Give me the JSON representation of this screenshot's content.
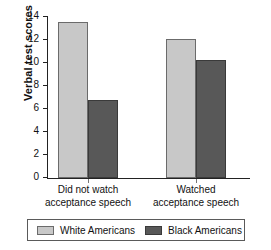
{
  "chart_data": {
    "type": "bar",
    "title": "",
    "xlabel": "",
    "ylabel": "Verbal test scores",
    "ylim": [
      0,
      14
    ],
    "ytick_labels": [
      "0",
      "2",
      "4",
      "6",
      "8",
      "10",
      "12",
      "14"
    ],
    "ytick_values": [
      0,
      2,
      4,
      6,
      8,
      10,
      12,
      14
    ],
    "grid": false,
    "legend_position": "bottom",
    "categories": [
      "Did not watch acceptance speech",
      "Watched acceptance speech"
    ],
    "category_lines": [
      [
        "Did not watch",
        "acceptance speech"
      ],
      [
        "Watched",
        "acceptance speech"
      ]
    ],
    "series": [
      {
        "name": "White Americans",
        "values": [
          13.6,
          12.1
        ],
        "color": "#c8c8c8"
      },
      {
        "name": "Black Americans",
        "values": [
          6.8,
          10.3
        ],
        "color": "#585858"
      }
    ]
  },
  "legend": {
    "entries": [
      {
        "label": "White Americans"
      },
      {
        "label": "Black Americans"
      }
    ]
  }
}
